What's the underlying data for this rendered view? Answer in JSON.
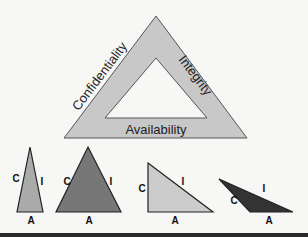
{
  "triad": {
    "sides": {
      "left": "Confidentiality",
      "right": "Integrity",
      "bottom": "Availability"
    },
    "fill": "#c8c8c8"
  },
  "examples": [
    {
      "c": "C",
      "i": "I",
      "a": "A",
      "fill": "#aaaaaa"
    },
    {
      "c": "C",
      "i": "I",
      "a": "A",
      "fill": "#777777"
    },
    {
      "c": "C",
      "i": "I",
      "a": "A",
      "fill": "#cccccc"
    },
    {
      "c": "C",
      "i": "I",
      "a": "A",
      "fill": "#333333"
    }
  ]
}
